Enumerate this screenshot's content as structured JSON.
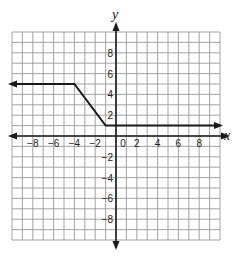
{
  "chart_data": {
    "type": "line",
    "title": "",
    "xlabel": "x",
    "ylabel": "y",
    "xlim": [
      -10,
      10
    ],
    "ylim": [
      -10,
      10
    ],
    "grid": true,
    "x_tick_labels": [
      "-8",
      "-6",
      "-4",
      "-2",
      "0",
      "2",
      "4",
      "6",
      "8"
    ],
    "x_ticks": [
      -8,
      -6,
      -4,
      -2,
      0,
      2,
      4,
      6,
      8
    ],
    "y_tick_labels": [
      "8",
      "6",
      "4",
      "2",
      "-2",
      "-4",
      "-6",
      "-8"
    ],
    "y_ticks": [
      8,
      6,
      4,
      2,
      -2,
      -4,
      -6,
      -8
    ],
    "series": [
      {
        "name": "piecewise function",
        "points": [
          [
            -10,
            5
          ],
          [
            -4,
            5
          ],
          [
            -1,
            1
          ],
          [
            10,
            1
          ]
        ],
        "left_arrow": true,
        "right_arrow": true
      }
    ]
  },
  "colors": {
    "grid": "#9a9a9a",
    "axis": "#1a1a1a",
    "line": "#1a1a1a"
  }
}
